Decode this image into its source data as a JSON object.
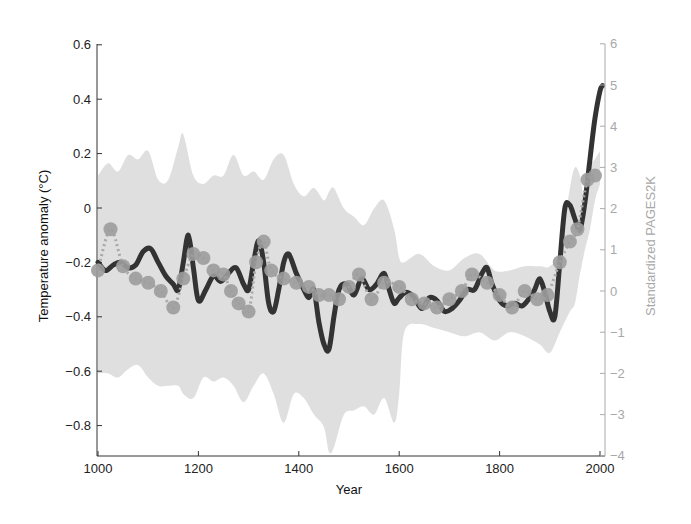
{
  "chart_data": {
    "type": "line",
    "title": "",
    "xlabel": "Year",
    "ylabel": "Temperature anomaly (°C)",
    "ylabel_right": "Standardized PAGES2K",
    "xlim": [
      1000,
      2010
    ],
    "ylim": [
      -0.9,
      0.6
    ],
    "ylim_right": [
      -4,
      6
    ],
    "x_ticks": [
      1000,
      1200,
      1400,
      1600,
      1800,
      2000
    ],
    "y_ticks": [
      0.6,
      0.4,
      0.2,
      0,
      -0.2,
      -0.4,
      -0.6,
      -0.8
    ],
    "y_ticks_right": [
      6,
      5,
      4,
      3,
      2,
      1,
      0,
      -1,
      -2,
      -3,
      -4
    ],
    "grid": false,
    "legend": null,
    "series": [
      {
        "name": "Temperature reconstruction (smoothed)",
        "axis": "left",
        "style": "thick solid line",
        "color": "#333333",
        "x": [
          1000,
          1015,
          1030,
          1045,
          1060,
          1075,
          1090,
          1105,
          1120,
          1135,
          1150,
          1160,
          1170,
          1180,
          1190,
          1200,
          1215,
          1230,
          1245,
          1260,
          1275,
          1290,
          1300,
          1310,
          1320,
          1330,
          1340,
          1350,
          1360,
          1370,
          1380,
          1395,
          1410,
          1420,
          1430,
          1440,
          1450,
          1460,
          1470,
          1480,
          1495,
          1510,
          1525,
          1540,
          1555,
          1570,
          1580,
          1590,
          1600,
          1615,
          1630,
          1645,
          1660,
          1675,
          1690,
          1705,
          1720,
          1735,
          1750,
          1765,
          1775,
          1785,
          1800,
          1815,
          1830,
          1845,
          1860,
          1870,
          1880,
          1890,
          1900,
          1910,
          1920,
          1930,
          1940,
          1950,
          1960,
          1970,
          1980,
          1990,
          2000,
          2005
        ],
        "values": [
          -0.2,
          -0.23,
          -0.21,
          -0.2,
          -0.22,
          -0.21,
          -0.16,
          -0.15,
          -0.2,
          -0.25,
          -0.28,
          -0.3,
          -0.2,
          -0.1,
          -0.22,
          -0.34,
          -0.3,
          -0.25,
          -0.27,
          -0.24,
          -0.22,
          -0.28,
          -0.3,
          -0.2,
          -0.12,
          -0.2,
          -0.35,
          -0.38,
          -0.3,
          -0.2,
          -0.17,
          -0.24,
          -0.3,
          -0.33,
          -0.3,
          -0.42,
          -0.5,
          -0.52,
          -0.4,
          -0.3,
          -0.28,
          -0.32,
          -0.26,
          -0.3,
          -0.28,
          -0.24,
          -0.3,
          -0.35,
          -0.33,
          -0.31,
          -0.33,
          -0.37,
          -0.33,
          -0.34,
          -0.38,
          -0.37,
          -0.34,
          -0.3,
          -0.3,
          -0.24,
          -0.22,
          -0.28,
          -0.34,
          -0.36,
          -0.35,
          -0.36,
          -0.33,
          -0.3,
          -0.26,
          -0.31,
          -0.38,
          -0.4,
          -0.2,
          0.0,
          0.01,
          -0.04,
          -0.08,
          0.02,
          0.18,
          0.33,
          0.43,
          0.45
        ]
      },
      {
        "name": "Standardized PAGES2K",
        "axis": "right",
        "style": "dotted line with circle markers",
        "color": "#999999",
        "x": [
          1000,
          1025,
          1050,
          1075,
          1100,
          1125,
          1150,
          1170,
          1190,
          1210,
          1230,
          1250,
          1265,
          1280,
          1300,
          1315,
          1330,
          1345,
          1370,
          1395,
          1420,
          1440,
          1460,
          1480,
          1500,
          1520,
          1545,
          1570,
          1600,
          1625,
          1650,
          1675,
          1700,
          1725,
          1745,
          1775,
          1800,
          1825,
          1850,
          1875,
          1895,
          1920,
          1940,
          1955,
          1975,
          1990
        ],
        "values": [
          0.5,
          1.5,
          0.6,
          0.3,
          0.2,
          0.0,
          -0.4,
          0.3,
          0.9,
          0.8,
          0.5,
          0.4,
          0.0,
          -0.3,
          -0.5,
          0.7,
          1.2,
          0.5,
          0.3,
          0.2,
          0.1,
          -0.1,
          -0.1,
          -0.2,
          0.1,
          0.4,
          -0.2,
          0.2,
          0.1,
          -0.2,
          -0.3,
          -0.4,
          -0.2,
          0.0,
          0.4,
          0.2,
          -0.1,
          -0.4,
          0.0,
          -0.2,
          -0.1,
          0.7,
          1.2,
          1.5,
          2.7,
          2.8
        ]
      },
      {
        "name": "Uncertainty band (PAGES2K spread)",
        "axis": "right",
        "style": "light gray shaded area",
        "color": "#d9d9d9",
        "x": [
          1000,
          1020,
          1040,
          1060,
          1080,
          1100,
          1120,
          1140,
          1160,
          1170,
          1190,
          1210,
          1230,
          1250,
          1270,
          1290,
          1310,
          1330,
          1350,
          1370,
          1390,
          1410,
          1430,
          1450,
          1460,
          1470,
          1490,
          1510,
          1530,
          1550,
          1570,
          1590,
          1600,
          1610,
          1640,
          1670,
          1700,
          1730,
          1760,
          1790,
          1820,
          1850,
          1880,
          1900,
          1920,
          1940,
          1950,
          1960,
          1970,
          1980,
          1990,
          2000
        ],
        "upper": [
          2.8,
          3.1,
          2.9,
          3.3,
          3.2,
          3.4,
          2.7,
          2.7,
          3.5,
          3.8,
          2.8,
          2.6,
          2.8,
          2.8,
          3.3,
          2.8,
          2.9,
          2.7,
          3.2,
          3.3,
          2.6,
          2.3,
          2.5,
          2.2,
          2.4,
          2.5,
          2.0,
          1.8,
          1.6,
          2.0,
          2.2,
          1.5,
          0.8,
          0.7,
          0.9,
          0.6,
          0.5,
          0.8,
          0.9,
          0.5,
          0.5,
          0.6,
          0.6,
          0.6,
          1.0,
          2.5,
          3.0,
          2.8,
          2.2,
          3.0,
          3.2,
          3.4
        ],
        "lower": [
          -2.0,
          -2.0,
          -2.1,
          -1.9,
          -1.8,
          -2.1,
          -2.3,
          -2.3,
          -2.3,
          -2.5,
          -2.6,
          -2.1,
          -2.2,
          -2.1,
          -2.3,
          -2.7,
          -2.3,
          -2.0,
          -2.5,
          -3.2,
          -2.5,
          -2.6,
          -3.0,
          -3.3,
          -3.9,
          -3.8,
          -3.0,
          -2.9,
          -2.8,
          -3.0,
          -2.6,
          -3.2,
          -2.5,
          -1.0,
          -0.8,
          -0.9,
          -1.0,
          -1.1,
          -1.0,
          -1.2,
          -1.0,
          -1.1,
          -1.3,
          -1.5,
          -1.0,
          -0.5,
          -0.3,
          0.4,
          1.0,
          1.5,
          2.2,
          2.6
        ]
      }
    ]
  }
}
